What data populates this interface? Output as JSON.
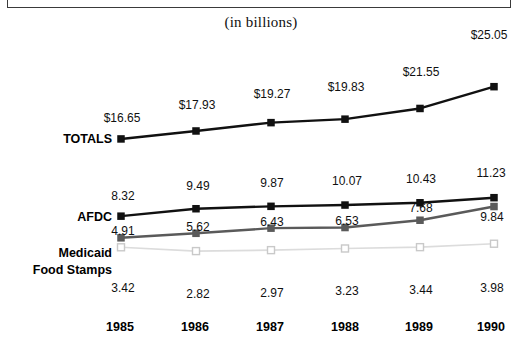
{
  "subtitle": "(in billions)",
  "colors": {
    "totals": "#111111",
    "afdc": "#111111",
    "medicaid": "#5a5a5a",
    "food_stamps": "#dcdcdc",
    "text": "#101010",
    "frame": "#3a3a3a"
  },
  "series_names": {
    "totals": "TOTALS",
    "afdc": "AFDC",
    "medicaid": "Medicaid",
    "food_stamps": "Food Stamps"
  },
  "years": [
    "1985",
    "1986",
    "1987",
    "1988",
    "1989",
    "1990"
  ],
  "totals_labels": [
    "$16.65",
    "$17.93",
    "$19.27",
    "$19.83",
    "$21.55",
    "$25.05"
  ],
  "afdc_labels": [
    "8.32",
    "9.49",
    "9.87",
    "10.07",
    "10.43",
    "11.23"
  ],
  "medicaid_labels": [
    "4.91",
    "5.62",
    "6.43",
    "6.53",
    "7.68",
    "9.84"
  ],
  "food_stamps_labels": [
    "3.42",
    "2.82",
    "2.97",
    "3.23",
    "3.44",
    "3.98"
  ],
  "chart_data": {
    "type": "line",
    "title": "",
    "subtitle": "(in billions)",
    "xlabel": "",
    "ylabel": "",
    "grid": false,
    "legend_position": "left-inline",
    "categories": [
      "1985",
      "1986",
      "1987",
      "1988",
      "1989",
      "1990"
    ],
    "series": [
      {
        "name": "TOTALS",
        "values": [
          16.65,
          17.93,
          19.27,
          19.83,
          21.55,
          25.05
        ],
        "labels": [
          "$16.65",
          "$17.93",
          "$19.27",
          "$19.83",
          "$21.55",
          "$25.05"
        ],
        "color": "#111111",
        "marker": "filled-square",
        "panel": "top"
      },
      {
        "name": "AFDC",
        "values": [
          8.32,
          9.49,
          9.87,
          10.07,
          10.43,
          11.23
        ],
        "labels": [
          "8.32",
          "9.49",
          "9.87",
          "10.07",
          "10.43",
          "11.23"
        ],
        "color": "#111111",
        "marker": "filled-square",
        "panel": "bottom"
      },
      {
        "name": "Medicaid",
        "values": [
          4.91,
          5.62,
          6.43,
          6.53,
          7.68,
          9.84
        ],
        "labels": [
          "4.91",
          "5.62",
          "6.43",
          "6.53",
          "7.68",
          "9.84"
        ],
        "color": "#5a5a5a",
        "marker": "filled-square",
        "panel": "bottom"
      },
      {
        "name": "Food Stamps",
        "values": [
          3.42,
          2.82,
          2.97,
          3.23,
          3.44,
          3.98
        ],
        "labels": [
          "3.42",
          "2.82",
          "2.97",
          "3.23",
          "3.44",
          "3.98"
        ],
        "color": "#dcdcdc",
        "marker": "open-square",
        "panel": "bottom"
      }
    ]
  }
}
